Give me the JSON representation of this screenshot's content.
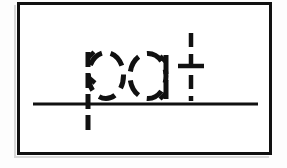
{
  "worksheet": {
    "word": "pat",
    "letters": [
      "p",
      "a",
      "t"
    ],
    "style_label": "dashed tracing guide",
    "frame_label": "worksheet frame",
    "baseline_label": "writing baseline"
  },
  "colors": {
    "ink": "#111111",
    "paper": "#ffffff",
    "page": "#fdfdfd",
    "shadow": "#d8d8d8"
  },
  "geometry": {
    "frame": {
      "x": 17,
      "y": 2,
      "width": 255,
      "height": 153,
      "stroke": 3
    },
    "baseline": {
      "x1": 33,
      "x2": 258,
      "y": 104,
      "stroke": 3
    },
    "stroke_width": 5,
    "dash_pattern": "12 7",
    "letter_p": {
      "stem": {
        "x": 88,
        "y_top": 52,
        "y_bottom": 132
      },
      "bowl": {
        "cx": 105,
        "cy": 75,
        "rx": 17,
        "ry": 23
      }
    },
    "letter_a": {
      "bowl": {
        "cx": 148,
        "cy": 76,
        "rx": 18,
        "ry": 22
      },
      "stem": {
        "x": 166,
        "y_top": 55,
        "y_bottom": 99
      }
    },
    "letter_t": {
      "stem": {
        "x": 191,
        "y_top": 33,
        "y_bottom": 101
      },
      "crossbar": {
        "x1": 178,
        "x2": 204,
        "y": 66
      }
    }
  }
}
